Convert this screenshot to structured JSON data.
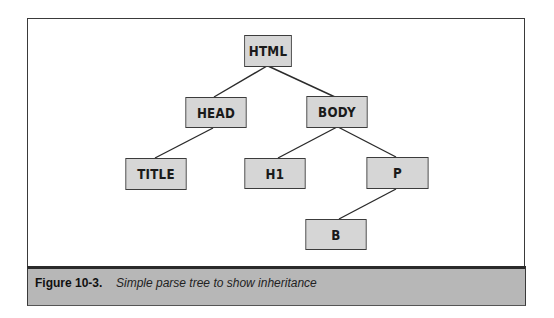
{
  "figure": {
    "label": "Figure 10-3.",
    "caption": "Simple parse tree to show inheritance"
  },
  "tree": {
    "nodes": {
      "html": "HTML",
      "head": "HEAD",
      "body": "BODY",
      "title": "TITLE",
      "h1": "H1",
      "p": "P",
      "b": "B"
    },
    "edges": [
      [
        "HTML",
        "HEAD"
      ],
      [
        "HTML",
        "BODY"
      ],
      [
        "HEAD",
        "TITLE"
      ],
      [
        "BODY",
        "H1"
      ],
      [
        "BODY",
        "P"
      ],
      [
        "P",
        "B"
      ]
    ]
  },
  "colors": {
    "node_fill": "#d6d6d6",
    "node_border": "#3c3c3c",
    "caption_fill": "#b7b7b7"
  }
}
